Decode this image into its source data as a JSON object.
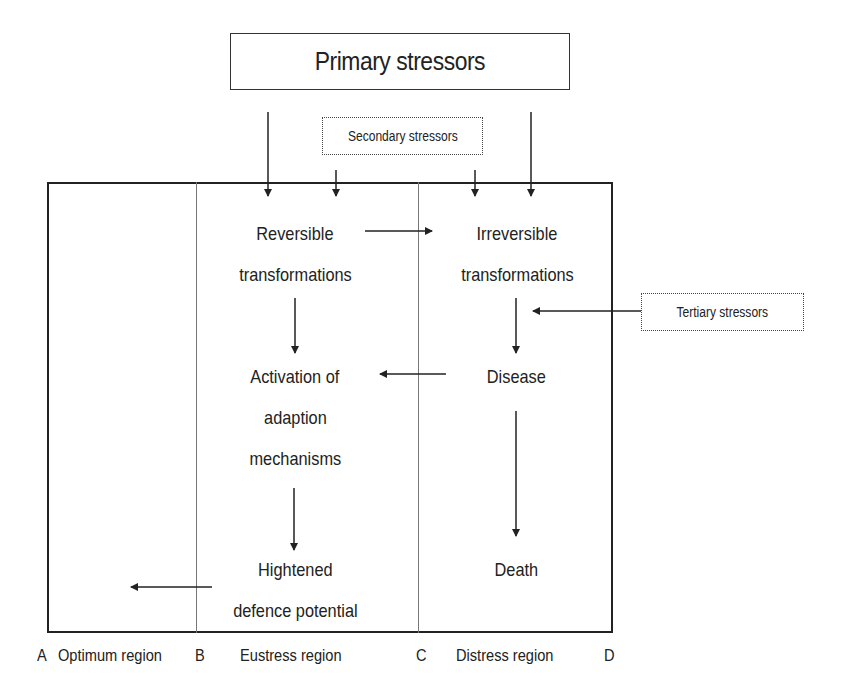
{
  "diagram": {
    "primary_stressors": "Primary stressors",
    "secondary_stressors": "Secondary stressors",
    "tertiary_stressors": "Tertiary stressors",
    "nodes": {
      "reversible": [
        "Reversible",
        "transformations"
      ],
      "irreversible": [
        "Irreversible",
        "transformations"
      ],
      "activation": [
        "Activation of",
        "adaption",
        "mechanisms"
      ],
      "disease": [
        "Disease"
      ],
      "hightened": [
        "Hightened",
        "defence potential"
      ],
      "death": [
        "Death"
      ]
    },
    "regions": {
      "a": "A",
      "optimum": "Optimum region",
      "b": "B",
      "eustress": "Eustress region",
      "c": "C",
      "distress": "Distress region",
      "d": "D"
    },
    "colors": {
      "line": "#222222",
      "divider": "#777777",
      "text": "#222222"
    }
  }
}
